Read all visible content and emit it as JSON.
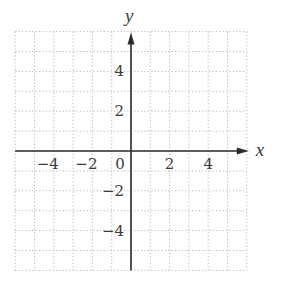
{
  "chart_data": {
    "type": "coordinate-plane",
    "title": "",
    "xlabel": "x",
    "ylabel": "y",
    "xlim": [
      -6,
      6
    ],
    "ylim": [
      -6,
      6
    ],
    "grid": true,
    "grid_style": "dotted",
    "grid_step": 1,
    "x_ticks": [
      {
        "value": -4,
        "label": "−4"
      },
      {
        "value": -2,
        "label": "−2"
      },
      {
        "value": 0,
        "label": "0"
      },
      {
        "value": 2,
        "label": "2"
      },
      {
        "value": 4,
        "label": "4"
      }
    ],
    "y_ticks": [
      {
        "value": 4,
        "label": "4"
      },
      {
        "value": 2,
        "label": "2"
      },
      {
        "value": -2,
        "label": "−2"
      },
      {
        "value": -4,
        "label": "−4"
      }
    ],
    "arrows": {
      "x_positive": true,
      "y_positive": true
    },
    "series": []
  },
  "colors": {
    "axis": "#2b2b2b",
    "grid": "#b8b8b8",
    "text": "#3a3a3a",
    "background": "#ffffff"
  }
}
